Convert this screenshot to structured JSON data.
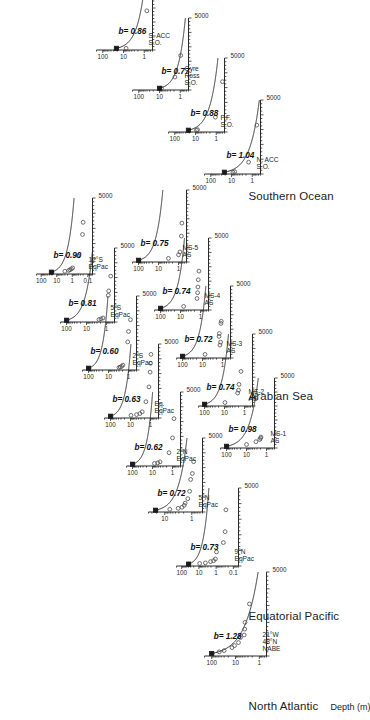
{
  "figure": {
    "x_axis_label": "Depth (m)",
    "x_ticks": [
      "1000",
      "2000",
      "3000",
      "4000",
      "5000"
    ],
    "x_end_tick": "5000",
    "regions": [
      {
        "name": "North Atlantic"
      },
      {
        "name": "Equatorial Pacific"
      },
      {
        "name": "Arabian Sea"
      },
      {
        "name": "Southern Ocean"
      }
    ]
  },
  "chart_data": {
    "type": "scatter",
    "title": "",
    "xlabel": "Depth (m)",
    "ylabel": "",
    "xlim": [
      0,
      5000
    ],
    "grid": false,
    "legend": "none",
    "note": "Martin-curve flux-vs-depth panels; b is the power-law attenuation exponent. Open circles are measured flux; the filled square is the reference flux at the base of the euphotic zone; the solid line is the fitted power law.",
    "panels": [
      {
        "region": "North Atlantic",
        "station": "NABE\n48°N\n21°W",
        "station_lines": [
          "NABE",
          "48°N",
          "21°W"
        ],
        "b_label": "b= 1.28",
        "b": 1.28,
        "y_ticks": [
          "1",
          "10",
          "100"
        ],
        "ylim": [
          0.5,
          200
        ],
        "ref_depth": 150,
        "ref_flux": 100,
        "points": [
          {
            "depth": 150,
            "flux": 95
          },
          {
            "depth": 250,
            "flux": 48
          },
          {
            "depth": 320,
            "flux": 30
          },
          {
            "depth": 500,
            "flux": 14
          },
          {
            "depth": 620,
            "flux": 11
          },
          {
            "depth": 800,
            "flux": 7.5
          },
          {
            "depth": 1100,
            "flux": 6.2
          },
          {
            "depth": 1250,
            "flux": 4.3
          },
          {
            "depth": 1600,
            "flux": 4.1
          },
          {
            "depth": 2000,
            "flux": 4.0
          },
          {
            "depth": 3100,
            "flux": 2.6
          }
        ]
      },
      {
        "region": "Equatorial Pacific",
        "station": "EqPac\n9°N",
        "station_lines": [
          "EqPac",
          "9°N"
        ],
        "b_label": "b= 0.73",
        "b": 0.73,
        "y_ticks": [
          "0.1",
          "1",
          "10",
          "100"
        ],
        "ylim": [
          0.05,
          200
        ],
        "ref_depth": 120,
        "ref_flux": 40,
        "points": [
          {
            "depth": 120,
            "flux": 38
          },
          {
            "depth": 160,
            "flux": 9.0
          },
          {
            "depth": 200,
            "flux": 4.2
          },
          {
            "depth": 280,
            "flux": 2.1
          },
          {
            "depth": 340,
            "flux": 1.4
          },
          {
            "depth": 450,
            "flux": 1.1
          },
          {
            "depth": 900,
            "flux": 0.95
          },
          {
            "depth": 1500,
            "flux": 0.38
          },
          {
            "depth": 2200,
            "flux": 0.3
          },
          {
            "depth": 3600,
            "flux": 0.27
          }
        ]
      },
      {
        "region": "Equatorial Pacific",
        "station": "EqPac\n5°N",
        "station_lines": [
          "EqPac",
          "5°N"
        ],
        "b_label": "b= 0.72",
        "b": 0.72,
        "y_ticks": [
          "1",
          "10"
        ],
        "ylim": [
          0.4,
          40
        ],
        "ref_depth": 120,
        "ref_flux": 22,
        "points": [
          {
            "depth": 120,
            "flux": 21
          },
          {
            "depth": 180,
            "flux": 6.5
          },
          {
            "depth": 250,
            "flux": 3.2
          },
          {
            "depth": 320,
            "flux": 2.3
          },
          {
            "depth": 450,
            "flux": 1.9
          },
          {
            "depth": 600,
            "flux": 1.75
          },
          {
            "depth": 900,
            "flux": 1.4
          },
          {
            "depth": 1400,
            "flux": 1.2
          },
          {
            "depth": 2200,
            "flux": 1.1
          },
          {
            "depth": 2600,
            "flux": 0.95
          },
          {
            "depth": 3400,
            "flux": 0.85
          }
        ]
      },
      {
        "region": "Equatorial Pacific",
        "station": "EqPac\n2°N",
        "station_lines": [
          "EqPac",
          "2°N"
        ],
        "b_label": "b= 0.62",
        "b": 0.62,
        "y_ticks": [
          "1",
          "10",
          "100"
        ],
        "ylim": [
          0.4,
          200
        ],
        "ref_depth": 120,
        "ref_flux": 100,
        "points": [
          {
            "depth": 120,
            "flux": 95
          },
          {
            "depth": 170,
            "flux": 8.0
          },
          {
            "depth": 210,
            "flux": 5.5
          },
          {
            "depth": 280,
            "flux": 4.2
          },
          {
            "depth": 900,
            "flux": 1.5
          },
          {
            "depth": 1900,
            "flux": 1.0
          },
          {
            "depth": 3200,
            "flux": 0.85
          }
        ]
      },
      {
        "region": "Equatorial Pacific",
        "station": "EqPac\nEq.",
        "station_lines": [
          "EqPac",
          "Eq."
        ],
        "b_label": "b= 0.63",
        "b": 0.63,
        "y_ticks": [
          "1",
          "10",
          "100"
        ],
        "ylim": [
          0.4,
          200
        ],
        "ref_depth": 120,
        "ref_flux": 100,
        "points": [
          {
            "depth": 120,
            "flux": 95
          },
          {
            "depth": 180,
            "flux": 9.5
          },
          {
            "depth": 230,
            "flux": 5.0
          },
          {
            "depth": 300,
            "flux": 3.4
          },
          {
            "depth": 420,
            "flux": 2.6
          },
          {
            "depth": 1100,
            "flux": 1.7
          },
          {
            "depth": 2100,
            "flux": 1.2
          },
          {
            "depth": 3100,
            "flux": 1.05
          },
          {
            "depth": 3700,
            "flux": 1.0
          },
          {
            "depth": 4300,
            "flux": 0.95
          }
        ]
      },
      {
        "region": "Equatorial Pacific",
        "station": "EqPac\n2°S",
        "station_lines": [
          "EqPac",
          "2°S"
        ],
        "b_label": "b= 0.60",
        "b": 0.6,
        "y_ticks": [
          "1",
          "10",
          "100"
        ],
        "ylim": [
          0.4,
          200
        ],
        "ref_depth": 120,
        "ref_flux": 100,
        "points": [
          {
            "depth": 120,
            "flux": 95
          },
          {
            "depth": 170,
            "flux": 3.0
          },
          {
            "depth": 200,
            "flux": 2.6
          },
          {
            "depth": 250,
            "flux": 2.2
          },
          {
            "depth": 330,
            "flux": 1.9
          },
          {
            "depth": 1900,
            "flux": 1.1
          },
          {
            "depth": 2600,
            "flux": 1.0
          },
          {
            "depth": 3400,
            "flux": 0.8
          }
        ]
      },
      {
        "region": "Equatorial Pacific",
        "station": "EqPac\n5°S",
        "station_lines": [
          "EqPac",
          "5°S"
        ],
        "b_label": "b= 0.81",
        "b": 0.81,
        "y_ticks": [
          "1",
          "10",
          "100"
        ],
        "ylim": [
          0.4,
          200
        ],
        "ref_depth": 120,
        "ref_flux": 100,
        "points": [
          {
            "depth": 120,
            "flux": 95
          },
          {
            "depth": 170,
            "flux": 2.4
          },
          {
            "depth": 210,
            "flux": 1.9
          },
          {
            "depth": 270,
            "flux": 1.5
          },
          {
            "depth": 1800,
            "flux": 0.82
          },
          {
            "depth": 2100,
            "flux": 0.78
          },
          {
            "depth": 3100,
            "flux": 0.62
          }
        ]
      },
      {
        "region": "Equatorial Pacific",
        "station": "EqPac\n12°S",
        "station_lines": [
          "EqPac",
          "12°S"
        ],
        "b_label": "b= 0.90",
        "b": 0.9,
        "y_ticks": [
          "0.1",
          "1",
          "10",
          "100"
        ],
        "ylim": [
          0.05,
          200
        ],
        "ref_depth": 120,
        "ref_flux": 22,
        "points": [
          {
            "depth": 120,
            "flux": 20
          },
          {
            "depth": 180,
            "flux": 3.0
          },
          {
            "depth": 230,
            "flux": 1.7
          },
          {
            "depth": 280,
            "flux": 1.4
          },
          {
            "depth": 330,
            "flux": 1.15
          },
          {
            "depth": 400,
            "flux": 0.95
          },
          {
            "depth": 1200,
            "flux": 0.42
          },
          {
            "depth": 2600,
            "flux": 0.22
          },
          {
            "depth": 3400,
            "flux": 0.2
          }
        ]
      },
      {
        "region": "Arabian Sea",
        "station": "AS\nMS-1",
        "station_lines": [
          "AS",
          "MS-1"
        ],
        "b_label": "b= 0.98",
        "b": 0.98,
        "y_ticks": [
          "1",
          "10",
          "100"
        ],
        "ylim": [
          0.4,
          200
        ],
        "ref_depth": 120,
        "ref_flux": 100,
        "points": [
          {
            "depth": 120,
            "flux": 95
          },
          {
            "depth": 250,
            "flux": 10
          },
          {
            "depth": 450,
            "flux": 3.4
          },
          {
            "depth": 600,
            "flux": 2.2
          },
          {
            "depth": 700,
            "flux": 2.0
          },
          {
            "depth": 780,
            "flux": 1.9
          }
        ]
      },
      {
        "region": "Arabian Sea",
        "station": "AS\nMS-2",
        "station_lines": [
          "AS",
          "MS-2"
        ],
        "b_label": "b= 0.74",
        "b": 0.74,
        "y_ticks": [
          "1",
          "10",
          "100"
        ],
        "ylim": [
          0.4,
          200
        ],
        "ref_depth": 120,
        "ref_flux": 100,
        "points": [
          {
            "depth": 120,
            "flux": 95
          },
          {
            "depth": 240,
            "flux": 9.5
          },
          {
            "depth": 900,
            "flux": 2.2
          },
          {
            "depth": 1100,
            "flux": 2.0
          },
          {
            "depth": 1500,
            "flux": 1.9
          },
          {
            "depth": 2400,
            "flux": 1.5
          }
        ]
      },
      {
        "region": "Arabian Sea",
        "station": "AS\nMS-3",
        "station_lines": [
          "AS",
          "MS-3"
        ],
        "b_label": "b= 0.72",
        "b": 0.72,
        "y_ticks": [
          "1",
          "10",
          "100"
        ],
        "ylim": [
          0.4,
          200
        ],
        "ref_depth": 120,
        "ref_flux": 100,
        "points": [
          {
            "depth": 120,
            "flux": 95
          },
          {
            "depth": 250,
            "flux": 7.5
          },
          {
            "depth": 900,
            "flux": 1.35
          },
          {
            "depth": 1100,
            "flux": 1.25
          },
          {
            "depth": 1500,
            "flux": 1.5
          },
          {
            "depth": 1700,
            "flux": 1.45
          },
          {
            "depth": 2400,
            "flux": 1.2
          },
          {
            "depth": 2550,
            "flux": 1.15
          }
        ]
      },
      {
        "region": "Arabian Sea",
        "station": "AS\nMS-4",
        "station_lines": [
          "AS",
          "MS-4"
        ],
        "b_label": "b= 0.74",
        "b": 0.74,
        "y_ticks": [
          "1",
          "10",
          "100"
        ],
        "ylim": [
          0.4,
          200
        ],
        "ref_depth": 120,
        "ref_flux": 100,
        "points": [
          {
            "depth": 120,
            "flux": 95
          },
          {
            "depth": 250,
            "flux": 7.0
          },
          {
            "depth": 800,
            "flux": 1.5
          },
          {
            "depth": 1200,
            "flux": 1.4
          },
          {
            "depth": 1600,
            "flux": 1.35
          },
          {
            "depth": 2100,
            "flux": 1.3
          },
          {
            "depth": 2700,
            "flux": 1.2
          }
        ]
      },
      {
        "region": "Arabian Sea",
        "station": "AS\nMS-5",
        "station_lines": [
          "AS",
          "MS-5"
        ],
        "b_label": "b= 0.75",
        "b": 0.75,
        "y_ticks": [
          "1",
          "10",
          "100"
        ],
        "ylim": [
          0.4,
          200
        ],
        "ref_depth": 120,
        "ref_flux": 100,
        "points": [
          {
            "depth": 120,
            "flux": 95
          },
          {
            "depth": 250,
            "flux": 3.2
          },
          {
            "depth": 500,
            "flux": 1.0
          },
          {
            "depth": 700,
            "flux": 0.85
          },
          {
            "depth": 1800,
            "flux": 0.72
          },
          {
            "depth": 2700,
            "flux": 0.68
          }
        ]
      },
      {
        "region": "Southern Ocean",
        "station": "S.O.\nN. ACC",
        "station_lines": [
          "S.O.",
          "N. ACC"
        ],
        "b_label": "b= 1.04",
        "b": 1.04,
        "y_ticks": [
          "1",
          "10",
          "100"
        ],
        "ylim": [
          0.4,
          200
        ],
        "ref_depth": 120,
        "ref_flux": 22,
        "points": [
          {
            "depth": 120,
            "flux": 8.5
          },
          {
            "depth": 160,
            "flux": 7.0
          },
          {
            "depth": 800,
            "flux": 1.5
          },
          {
            "depth": 3300,
            "flux": 0.6
          }
        ]
      },
      {
        "region": "Southern Ocean",
        "station": "S.O.\nP.F.",
        "station_lines": [
          "S.O.",
          "P.F."
        ],
        "b_label": "b= 0.88",
        "b": 0.88,
        "y_ticks": [
          "1",
          "10",
          "100"
        ],
        "ylim": [
          0.4,
          200
        ],
        "ref_depth": 120,
        "ref_flux": 22,
        "points": [
          {
            "depth": 120,
            "flux": 9.0
          },
          {
            "depth": 160,
            "flux": 8.0
          },
          {
            "depth": 1000,
            "flux": 1.1
          },
          {
            "depth": 3400,
            "flux": 0.5
          }
        ]
      },
      {
        "region": "Southern Ocean",
        "station": "S.O.\nRoss\nGyre",
        "station_lines": [
          "S.O.",
          "Ross",
          "Gyre"
        ],
        "b_label": "b= 0.77",
        "b": 0.77,
        "y_ticks": [
          "1",
          "10",
          "100"
        ],
        "ylim": [
          0.4,
          200
        ],
        "ref_depth": 120,
        "ref_flux": 10,
        "points": [
          {
            "depth": 120,
            "flux": 8.0
          },
          {
            "depth": 900,
            "flux": 1.8
          },
          {
            "depth": 2400,
            "flux": 0.95
          }
        ]
      },
      {
        "region": "Southern Ocean",
        "station": "S.O.\nS. ACC",
        "station_lines": [
          "S.O.",
          "S. ACC"
        ],
        "b_label": "b= 0.86",
        "b": 0.86,
        "y_ticks": [
          "1",
          "10",
          "100"
        ],
        "ylim": [
          0.4,
          200
        ],
        "ref_depth": 120,
        "ref_flux": 22,
        "points": [
          {
            "depth": 120,
            "flux": 7.5
          },
          {
            "depth": 2800,
            "flux": 0.75
          }
        ]
      }
    ]
  }
}
